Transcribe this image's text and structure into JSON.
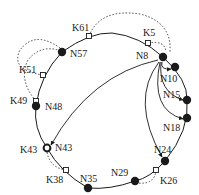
{
  "diagram": {
    "type": "chord-ring",
    "colors": {
      "ink": "#1a1a1a",
      "background": "#ffffff"
    },
    "nodes": [
      {
        "id": "N8",
        "label": "N8",
        "x": 163,
        "y": 57,
        "lx": 136,
        "ly": 59,
        "style": "filled"
      },
      {
        "id": "N10",
        "label": "N10",
        "x": 175,
        "y": 67,
        "lx": 160,
        "ly": 82,
        "style": "filled"
      },
      {
        "id": "N15",
        "label": "N15",
        "x": 187,
        "y": 100,
        "lx": 163,
        "ly": 98,
        "style": "filled"
      },
      {
        "id": "N18",
        "label": "N18",
        "x": 187,
        "y": 118,
        "lx": 163,
        "ly": 131,
        "style": "filled"
      },
      {
        "id": "N24",
        "label": "N24",
        "x": 165,
        "y": 161,
        "lx": 154,
        "ly": 153,
        "style": "filled"
      },
      {
        "id": "N29",
        "label": "N29",
        "x": 135,
        "y": 181,
        "lx": 111,
        "ly": 176,
        "style": "filled"
      },
      {
        "id": "N35",
        "label": "N35",
        "x": 88,
        "y": 188,
        "lx": 80,
        "ly": 182,
        "style": "filled"
      },
      {
        "id": "N43",
        "label": "N43",
        "x": 47,
        "y": 148,
        "lx": 55,
        "ly": 151,
        "style": "ring"
      },
      {
        "id": "N48",
        "label": "N48",
        "x": 36,
        "y": 106,
        "lx": 45,
        "ly": 110,
        "style": "filled"
      },
      {
        "id": "N57",
        "label": "N57",
        "x": 62,
        "y": 52,
        "lx": 70,
        "ly": 57,
        "style": "filled"
      }
    ],
    "keys": [
      {
        "id": "K5",
        "label": "K5",
        "x": 148,
        "y": 43,
        "lx": 143,
        "ly": 36,
        "successor": "N8"
      },
      {
        "id": "K26",
        "label": "K26",
        "x": 156,
        "y": 170,
        "lx": 160,
        "ly": 184,
        "successor": "N29"
      },
      {
        "id": "K38",
        "label": "K38",
        "x": 66,
        "y": 170,
        "lx": 46,
        "ly": 183,
        "successor": "N43"
      },
      {
        "id": "K49",
        "label": "K49",
        "x": 36,
        "y": 101,
        "lx": 10,
        "ly": 104,
        "successor": "N57"
      },
      {
        "id": "K51",
        "label": "K51",
        "x": 43,
        "y": 75,
        "lx": 19,
        "ly": 73,
        "successor": "N57"
      },
      {
        "id": "K61",
        "label": "K61",
        "x": 89,
        "y": 36,
        "lx": 72,
        "ly": 31,
        "successor": "N8"
      }
    ],
    "fingers_from": "N8",
    "fingers_to": [
      "N10",
      "N15",
      "N18",
      "N24",
      "N43"
    ]
  }
}
